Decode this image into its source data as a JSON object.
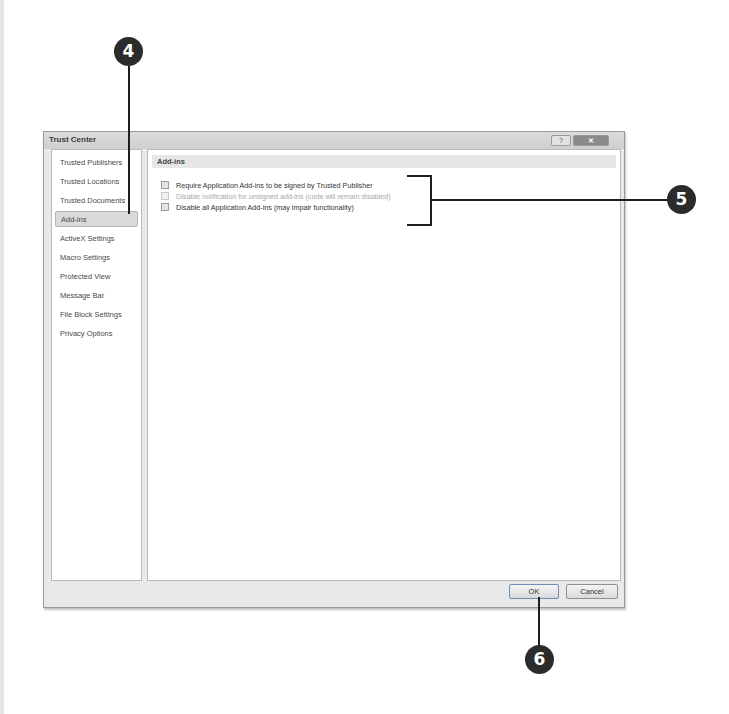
{
  "dialog": {
    "title": "Trust Center",
    "help_button": "?",
    "close_button": "✕"
  },
  "nav": {
    "items": [
      {
        "label": "Trusted Publishers",
        "selected": false
      },
      {
        "label": "Trusted Locations",
        "selected": false
      },
      {
        "label": "Trusted Documents",
        "selected": false
      },
      {
        "label": "Add-ins",
        "selected": true
      },
      {
        "label": "ActiveX Settings",
        "selected": false
      },
      {
        "label": "Macro Settings",
        "selected": false
      },
      {
        "label": "Protected View",
        "selected": false
      },
      {
        "label": "Message Bar",
        "selected": false
      },
      {
        "label": "File Block Settings",
        "selected": false
      },
      {
        "label": "Privacy Options",
        "selected": false
      }
    ]
  },
  "content": {
    "section_title": "Add-ins",
    "options": [
      {
        "label": "Require Application Add-ins to be signed by Trusted Publisher",
        "checked": false,
        "enabled": true
      },
      {
        "label": "Disable notification for unsigned add-ins (code will remain disabled)",
        "checked": false,
        "enabled": false
      },
      {
        "label": "Disable all Application Add-ins (may impair functionality)",
        "checked": false,
        "enabled": true
      }
    ]
  },
  "footer": {
    "ok_label": "OK",
    "cancel_label": "Cancel"
  },
  "callouts": {
    "c4": "4",
    "c5": "5",
    "c6": "6"
  }
}
